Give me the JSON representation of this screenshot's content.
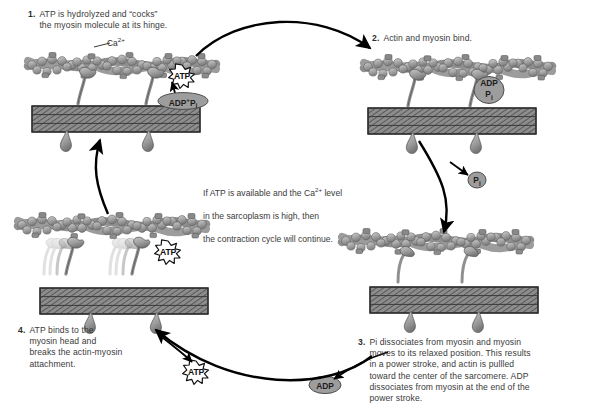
{
  "figure": {
    "background": "#ffffff",
    "ink": "#000000",
    "text_color": "#3a3a3a",
    "filament_fill": "#9a9a9a",
    "thick_filament_fill": "#6e6e6e"
  },
  "steps": [
    {
      "id": "step-1",
      "number": "1.",
      "text": "ATP is hydrolyzed and “cocks”\nthe myosin molecule at its hinge."
    },
    {
      "id": "step-2",
      "number": "2.",
      "text": "Actin and myosin bind."
    },
    {
      "id": "step-3",
      "number": "3.",
      "text": "Pi dissociates from myosin and myosin\nmoves to its relaxed position. This results\nin a power stroke, and actin is pullled\ntoward the center of the sarcomere. ADP\ndissociates from myosin at the end of the\npower stroke."
    },
    {
      "id": "step-4",
      "number": "4.",
      "text": "ATP binds to the\nmyosin head and\nbreaks the actin-myosin\nattachment."
    }
  ],
  "center_note": {
    "line1_a": "If ATP is available and the Ca",
    "line1_sup": "2+",
    "line1_b": " level",
    "line2": "in the sarcoplasm is high, then",
    "line3": "the contraction cycle will continue."
  },
  "labels": {
    "calcium": {
      "base": "Ca",
      "sup": "2+"
    },
    "atp_burst_1": "ATP",
    "atp_burst_4": "ATP",
    "atp_burst_bottom": "ATP",
    "adp_pi_panel1": {
      "adp": "ADP",
      "plus": "+",
      "p": "P",
      "i": "i"
    },
    "adp_pi_panel2": {
      "adp": "ADP",
      "p": "P",
      "i": "i"
    },
    "pi_free": {
      "p": "P",
      "i": "i"
    },
    "adp_free": "ADP"
  },
  "panels": [
    {
      "id": "panel-1",
      "name": "atp-hydrolyzed-panel"
    },
    {
      "id": "panel-2",
      "name": "actin-myosin-bind-panel"
    },
    {
      "id": "panel-3",
      "name": "power-stroke-panel"
    },
    {
      "id": "panel-4",
      "name": "atp-binds-panel"
    }
  ],
  "arrows": [
    {
      "id": "arrow-1-to-2",
      "name": "cycle-arrow-top"
    },
    {
      "id": "arrow-2-to-3",
      "name": "cycle-arrow-right"
    },
    {
      "id": "arrow-3-to-4",
      "name": "cycle-arrow-bottom"
    },
    {
      "id": "arrow-4-to-1",
      "name": "cycle-arrow-left"
    },
    {
      "id": "arrow-pi-release",
      "name": "pi-release-arrow"
    },
    {
      "id": "arrow-adp-release",
      "name": "adp-release-arrow"
    },
    {
      "id": "arrow-atp-bind",
      "name": "atp-binding-arrow"
    },
    {
      "id": "arrow-adp-pi-up",
      "name": "adp-pi-to-atp-arrow"
    },
    {
      "id": "arrow-ca-leader",
      "name": "calcium-leader-line"
    }
  ]
}
